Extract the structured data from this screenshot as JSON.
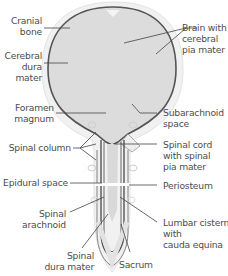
{
  "diagram": {
    "colors": {
      "brain_fill": "#dedede",
      "outer_bone": "#efefef",
      "dura_line": "#5a5a5a",
      "leader_line": "#444444",
      "label_text": "#4d4d4d"
    },
    "labels_left": [
      {
        "id": "cranial-bone",
        "lines": [
          "Cranial",
          "bone"
        ]
      },
      {
        "id": "cerebral-dura-mater",
        "lines": [
          "Cerebral",
          "dura",
          "mater"
        ]
      },
      {
        "id": "foramen-magnum",
        "lines": [
          "Foramen",
          "magnum"
        ]
      },
      {
        "id": "spinal-column",
        "lines": [
          "Spinal column"
        ]
      },
      {
        "id": "epidural-space",
        "lines": [
          "Epidural space"
        ]
      },
      {
        "id": "spinal-arachnoid",
        "lines": [
          "Spinal",
          "arachnoid"
        ]
      },
      {
        "id": "spinal-dura-mater",
        "lines": [
          "Spinal",
          "dura mater"
        ]
      }
    ],
    "labels_right": [
      {
        "id": "brain-with-cerebral-pia-mater",
        "lines": [
          "Brain with",
          "cerebral",
          "pia mater"
        ]
      },
      {
        "id": "subarachnoid-space",
        "lines": [
          "Subarachnoid",
          "space"
        ]
      },
      {
        "id": "spinal-cord-with-spinal-pia-mater",
        "lines": [
          "Spinal cord",
          "with spinal",
          "pia mater"
        ]
      },
      {
        "id": "periosteum",
        "lines": [
          "Periosteum"
        ]
      },
      {
        "id": "lumbar-cistern-with-cauda-equina",
        "lines": [
          "Lumbar cistern",
          "with",
          "cauda equina"
        ]
      },
      {
        "id": "sacrum",
        "lines": [
          "Sacrum"
        ]
      }
    ]
  }
}
